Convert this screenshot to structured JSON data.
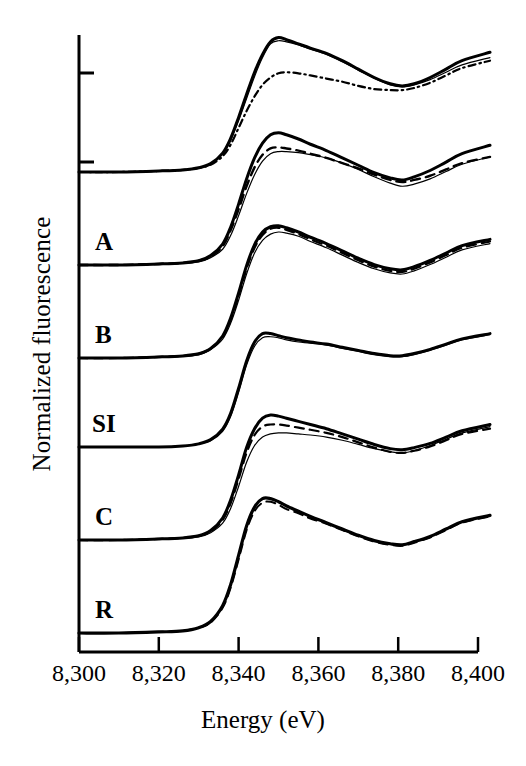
{
  "figure": {
    "background": "#ffffff",
    "ink": "#000000"
  },
  "axes": {
    "xlabel": "Energy (eV)",
    "ylabel": "Normalized fluorescence",
    "x_tick_labels": [
      "8,300",
      "8,320",
      "8,340",
      "8,360",
      "8,380",
      "8,400"
    ],
    "x_tick_values": [
      8300,
      8320,
      8340,
      8360,
      8380,
      8400
    ],
    "xlim": [
      8300,
      8400
    ],
    "y_tick_labels": [],
    "y_ticks_unlabeled": 2,
    "grid": false,
    "legend": "none"
  },
  "curve_labels": [
    {
      "text": "A",
      "x": 95,
      "y": 228
    },
    {
      "text": "B",
      "x": 95,
      "y": 321
    },
    {
      "text": "SI",
      "x": 92,
      "y": 410
    },
    {
      "text": "C",
      "x": 95,
      "y": 503
    },
    {
      "text": "R",
      "x": 95,
      "y": 596
    }
  ],
  "chart_data": {
    "type": "line",
    "title": "",
    "xlabel": "Energy (eV)",
    "ylabel": "Normalized fluorescence",
    "xlim": [
      8300,
      8400
    ],
    "grid": false,
    "legend_position": "none",
    "note": "Stacked normalized Ni K-edge XANES spectra; each group offset vertically, y axis in arbitrary normalized units.",
    "x": [
      8300,
      8310,
      8320,
      8326,
      8330,
      8333,
      8336,
      8338,
      8340,
      8342,
      8344,
      8346,
      8348,
      8350,
      8352,
      8355,
      8358,
      8362,
      8366,
      8370,
      8374,
      8378,
      8381,
      8384,
      8388,
      8392,
      8396,
      8400
    ],
    "groups": [
      {
        "name": "top",
        "label": "",
        "baseline_y_px": 172,
        "series": [
          {
            "name": "solid-thick",
            "style": "solid",
            "width": 3.0,
            "values": [
              0.0,
              0.0,
              0.01,
              0.02,
              0.04,
              0.08,
              0.18,
              0.32,
              0.52,
              0.74,
              0.95,
              1.12,
              1.24,
              1.28,
              1.26,
              1.22,
              1.18,
              1.13,
              1.06,
              0.98,
              0.9,
              0.84,
              0.82,
              0.84,
              0.9,
              0.98,
              1.06,
              1.14
            ]
          },
          {
            "name": "solid-thin",
            "style": "solid",
            "width": 1.2,
            "values": [
              0.0,
              0.0,
              0.01,
              0.02,
              0.04,
              0.08,
              0.17,
              0.3,
              0.49,
              0.7,
              0.91,
              1.09,
              1.22,
              1.25,
              1.24,
              1.21,
              1.17,
              1.12,
              1.05,
              0.97,
              0.89,
              0.83,
              0.81,
              0.83,
              0.88,
              0.95,
              1.02,
              1.09
            ]
          },
          {
            "name": "dash-dot",
            "style": "dashdot",
            "width": 2.2,
            "values": [
              0.0,
              0.0,
              0.01,
              0.02,
              0.04,
              0.07,
              0.15,
              0.26,
              0.42,
              0.58,
              0.72,
              0.83,
              0.9,
              0.94,
              0.95,
              0.94,
              0.92,
              0.89,
              0.86,
              0.82,
              0.79,
              0.78,
              0.78,
              0.8,
              0.85,
              0.92,
              0.99,
              1.06
            ]
          }
        ]
      },
      {
        "name": "A",
        "label": "A",
        "baseline_y_px": 265,
        "series": [
          {
            "name": "solid-thick",
            "style": "solid",
            "width": 3.0,
            "values": [
              0.0,
              0.0,
              0.01,
              0.02,
              0.04,
              0.09,
              0.2,
              0.36,
              0.58,
              0.82,
              1.02,
              1.16,
              1.24,
              1.26,
              1.24,
              1.2,
              1.15,
              1.09,
              1.02,
              0.95,
              0.88,
              0.83,
              0.81,
              0.84,
              0.9,
              0.98,
              1.06,
              1.14
            ]
          },
          {
            "name": "dashed",
            "style": "dashed",
            "width": 2.4,
            "values": [
              0.0,
              0.0,
              0.01,
              0.02,
              0.04,
              0.08,
              0.18,
              0.33,
              0.53,
              0.75,
              0.93,
              1.05,
              1.11,
              1.12,
              1.11,
              1.09,
              1.06,
              1.02,
              0.97,
              0.92,
              0.86,
              0.81,
              0.79,
              0.81,
              0.85,
              0.91,
              0.97,
              1.03
            ]
          },
          {
            "name": "solid-thin",
            "style": "solid",
            "width": 1.2,
            "values": [
              0.0,
              0.0,
              0.01,
              0.02,
              0.03,
              0.07,
              0.15,
              0.28,
              0.47,
              0.68,
              0.86,
              0.99,
              1.06,
              1.08,
              1.08,
              1.07,
              1.05,
              1.02,
              0.97,
              0.91,
              0.84,
              0.78,
              0.75,
              0.77,
              0.82,
              0.89,
              0.96,
              1.03
            ]
          }
        ]
      },
      {
        "name": "B",
        "label": "B",
        "baseline_y_px": 358,
        "series": [
          {
            "name": "solid-thick",
            "style": "solid",
            "width": 3.0,
            "values": [
              0.0,
              0.0,
              0.01,
              0.02,
              0.04,
              0.09,
              0.21,
              0.38,
              0.62,
              0.88,
              1.08,
              1.2,
              1.25,
              1.26,
              1.24,
              1.2,
              1.15,
              1.09,
              1.02,
              0.95,
              0.89,
              0.85,
              0.84,
              0.87,
              0.93,
              1.0,
              1.07,
              1.13
            ]
          },
          {
            "name": "dashed",
            "style": "dashed",
            "width": 2.2,
            "values": [
              0.0,
              0.0,
              0.01,
              0.02,
              0.04,
              0.09,
              0.2,
              0.36,
              0.59,
              0.85,
              1.05,
              1.17,
              1.23,
              1.24,
              1.22,
              1.18,
              1.13,
              1.07,
              1.0,
              0.93,
              0.87,
              0.83,
              0.82,
              0.85,
              0.91,
              0.98,
              1.05,
              1.11
            ]
          },
          {
            "name": "solid-thin",
            "style": "solid",
            "width": 1.2,
            "values": [
              0.0,
              0.0,
              0.01,
              0.02,
              0.03,
              0.08,
              0.18,
              0.33,
              0.55,
              0.8,
              1.0,
              1.12,
              1.18,
              1.2,
              1.19,
              1.16,
              1.11,
              1.05,
              0.98,
              0.91,
              0.85,
              0.81,
              0.8,
              0.83,
              0.89,
              0.96,
              1.03,
              1.09
            ]
          }
        ]
      },
      {
        "name": "SI",
        "label": "SI",
        "baseline_y_px": 447,
        "series": [
          {
            "name": "solid-thick",
            "style": "solid",
            "width": 3.0,
            "values": [
              0.0,
              0.0,
              0.0,
              0.01,
              0.03,
              0.07,
              0.17,
              0.32,
              0.56,
              0.82,
              1.0,
              1.08,
              1.08,
              1.06,
              1.04,
              1.02,
              1.0,
              0.98,
              0.95,
              0.92,
              0.89,
              0.87,
              0.87,
              0.89,
              0.93,
              0.98,
              1.03,
              1.08
            ]
          },
          {
            "name": "solid-thin",
            "style": "solid",
            "width": 1.2,
            "values": [
              0.0,
              0.0,
              0.0,
              0.01,
              0.03,
              0.06,
              0.15,
              0.29,
              0.52,
              0.78,
              0.96,
              1.04,
              1.05,
              1.04,
              1.02,
              1.0,
              0.99,
              0.97,
              0.94,
              0.91,
              0.88,
              0.86,
              0.86,
              0.88,
              0.92,
              0.97,
              1.02,
              1.07
            ]
          }
        ]
      },
      {
        "name": "C",
        "label": "C",
        "baseline_y_px": 540,
        "series": [
          {
            "name": "solid-thick",
            "style": "solid",
            "width": 3.0,
            "values": [
              0.0,
              0.0,
              0.01,
              0.02,
              0.04,
              0.09,
              0.21,
              0.38,
              0.62,
              0.88,
              1.06,
              1.16,
              1.19,
              1.18,
              1.16,
              1.13,
              1.1,
              1.06,
              1.01,
              0.96,
              0.91,
              0.87,
              0.86,
              0.88,
              0.92,
              0.98,
              1.04,
              1.1
            ]
          },
          {
            "name": "dashed",
            "style": "dashed",
            "width": 2.2,
            "values": [
              0.0,
              0.0,
              0.01,
              0.02,
              0.04,
              0.08,
              0.19,
              0.35,
              0.58,
              0.83,
              1.0,
              1.08,
              1.1,
              1.1,
              1.09,
              1.07,
              1.05,
              1.02,
              0.98,
              0.93,
              0.88,
              0.84,
              0.83,
              0.85,
              0.89,
              0.95,
              1.01,
              1.06
            ]
          },
          {
            "name": "solid-thin",
            "style": "solid",
            "width": 1.2,
            "values": [
              0.0,
              0.0,
              0.01,
              0.02,
              0.03,
              0.07,
              0.16,
              0.3,
              0.51,
              0.74,
              0.9,
              0.98,
              1.01,
              1.02,
              1.02,
              1.01,
              1.0,
              0.98,
              0.95,
              0.91,
              0.87,
              0.84,
              0.83,
              0.85,
              0.9,
              0.96,
              1.02,
              1.08
            ]
          }
        ]
      },
      {
        "name": "R",
        "label": "R",
        "baseline_y_px": 633,
        "series": [
          {
            "name": "solid-thick",
            "style": "solid",
            "width": 3.2,
            "values": [
              0.0,
              0.0,
              0.01,
              0.02,
              0.05,
              0.11,
              0.26,
              0.46,
              0.74,
              1.02,
              1.2,
              1.28,
              1.28,
              1.25,
              1.21,
              1.16,
              1.11,
              1.05,
              0.99,
              0.93,
              0.88,
              0.85,
              0.84,
              0.87,
              0.92,
              0.99,
              1.06,
              1.12
            ]
          },
          {
            "name": "dashed",
            "style": "dashed",
            "width": 2.0,
            "values": [
              0.0,
              0.0,
              0.01,
              0.02,
              0.05,
              0.1,
              0.24,
              0.43,
              0.7,
              0.98,
              1.16,
              1.24,
              1.25,
              1.22,
              1.18,
              1.14,
              1.09,
              1.04,
              0.98,
              0.92,
              0.87,
              0.84,
              0.83,
              0.86,
              0.91,
              0.98,
              1.05,
              1.11
            ]
          }
        ]
      }
    ]
  }
}
